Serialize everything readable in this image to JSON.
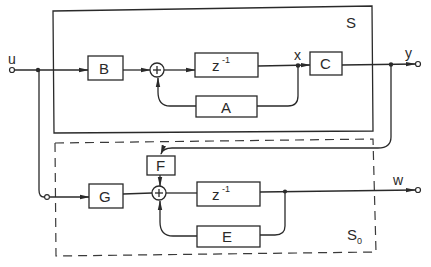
{
  "diagram": {
    "type": "block-diagram",
    "systems": {
      "S": {
        "label": "S",
        "border": "solid"
      },
      "S0": {
        "label": "S",
        "subscript": "0",
        "border": "dashed"
      }
    },
    "signals": {
      "input": "u",
      "state": "x",
      "output": "y",
      "observer_output": "w"
    },
    "blocks": {
      "B": "B",
      "A": "A",
      "C": "C",
      "delay1": {
        "base": "z",
        "exp": "-1"
      },
      "F": "F",
      "G": "G",
      "E": "E",
      "delay2": {
        "base": "z",
        "exp": "-1"
      }
    },
    "summers": {
      "sum1": "+",
      "sum2": "+"
    },
    "colors": {
      "ink": "#2a2a2a",
      "background": "#ffffff"
    }
  }
}
